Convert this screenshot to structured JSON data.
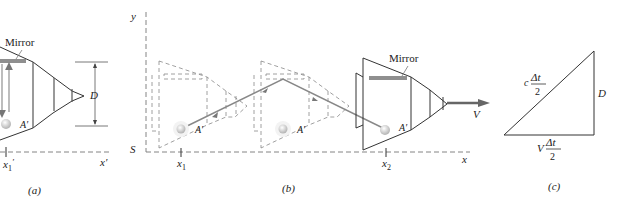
{
  "panel_a": {
    "mirror_label": "Mirror",
    "point_label": "A′",
    "dimension_label": "D",
    "tick_label": "x",
    "tick_sub": "1",
    "tick_prime": "′",
    "axis_label": "x′",
    "caption": "(a)"
  },
  "panel_b": {
    "y_axis_label": "y",
    "origin_label": "S",
    "x_axis_label": "x",
    "mirror_label": "Mirror",
    "point_label_1": "A′",
    "point_label_2": "A′",
    "point_label_3": "A′",
    "velocity_label": "V",
    "tick1_label": "x",
    "tick1_sub": "1",
    "tick2_label": "x",
    "tick2_sub": "2",
    "caption": "(b)"
  },
  "panel_c": {
    "hyp_coef": "c",
    "hyp_num": "Δt",
    "hyp_den": "2",
    "side_label": "D",
    "base_coef": "V",
    "base_num": "Δt",
    "base_den": "2",
    "caption": "(c)"
  },
  "colors": {
    "line": "#333333",
    "dashed": "#777777",
    "mirror": "#8a8a8a",
    "ray": "#888888",
    "arrow": "#666666"
  }
}
